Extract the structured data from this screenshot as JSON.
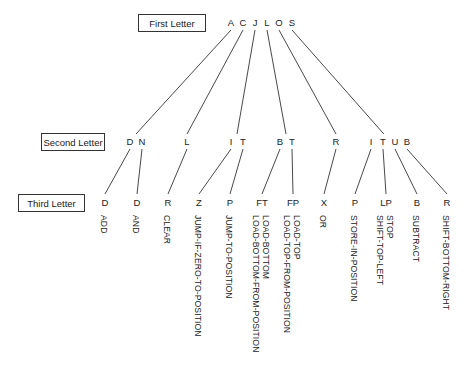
{
  "labels": {
    "first": "First Letter",
    "second": "Second Letter",
    "third": "Third Letter"
  },
  "first_letters": [
    {
      "letter": "A",
      "x": 231
    },
    {
      "letter": "C",
      "x": 243
    },
    {
      "letter": "J",
      "x": 255
    },
    {
      "letter": "L",
      "x": 267
    },
    {
      "letter": "O",
      "x": 279
    },
    {
      "letter": "S",
      "x": 292
    }
  ],
  "second_letters": [
    {
      "letter": "D",
      "x": 130,
      "parent": 0
    },
    {
      "letter": "N",
      "x": 142,
      "parent": 0
    },
    {
      "letter": "L",
      "x": 187,
      "parent": 1
    },
    {
      "letter": "I",
      "x": 231,
      "parent": 2
    },
    {
      "letter": "T",
      "x": 243,
      "parent": 2
    },
    {
      "letter": "B",
      "x": 280,
      "parent": 3
    },
    {
      "letter": "T",
      "x": 292,
      "parent": 3
    },
    {
      "letter": "R",
      "x": 336,
      "parent": 4
    },
    {
      "letter": "I",
      "x": 371,
      "parent": 5
    },
    {
      "letter": "T",
      "x": 383,
      "parent": 5
    },
    {
      "letter": "U",
      "x": 395,
      "parent": 5
    },
    {
      "letter": "B",
      "x": 407,
      "parent": 5
    }
  ],
  "third_letters": [
    {
      "letter": "D",
      "x": 105,
      "parent": 0,
      "words": [
        "ADD"
      ]
    },
    {
      "letter": "D",
      "x": 137,
      "parent": 1,
      "words": [
        "AND"
      ]
    },
    {
      "letter": "R",
      "x": 168,
      "parent": 2,
      "words": [
        "CLEAR"
      ]
    },
    {
      "letter": "Z",
      "x": 199,
      "parent": 3,
      "words": [
        "JUMP-IF-ZERO-TO-POSITION"
      ]
    },
    {
      "letter": "P",
      "x": 230,
      "parent": 4,
      "words": [
        "JUMP-TO-POSITION"
      ]
    },
    {
      "letter": "FT",
      "x": 262,
      "parent": 5,
      "words": [
        "LOAD-BOTTOM",
        "LOAD-BOTTOM-FROM-POSITION"
      ]
    },
    {
      "letter": "FP",
      "x": 293,
      "parent": 6,
      "words": [
        "LOAD-TOP",
        "LOAD-TOP-FROM-POSITION"
      ]
    },
    {
      "letter": "X",
      "x": 324,
      "parent": 7,
      "words": [
        "OR"
      ]
    },
    {
      "letter": "P",
      "x": 355,
      "parent": 8,
      "words": [
        "STORE-IN-POSITION"
      ]
    },
    {
      "letter": "LP",
      "x": 386,
      "parent": 9,
      "words": [
        "STOP",
        "SHIFT-TOP-LEFT"
      ]
    },
    {
      "letter": "B",
      "x": 417,
      "parent": 10,
      "words": [
        "SUBTRACT"
      ]
    },
    {
      "letter": "R",
      "x": 447,
      "parent": 11,
      "words": [
        "SHIFT-BOTTOM-RIGHT"
      ]
    }
  ],
  "colors": {
    "line": "#333333",
    "text": "#222222",
    "background": "#ffffff"
  }
}
